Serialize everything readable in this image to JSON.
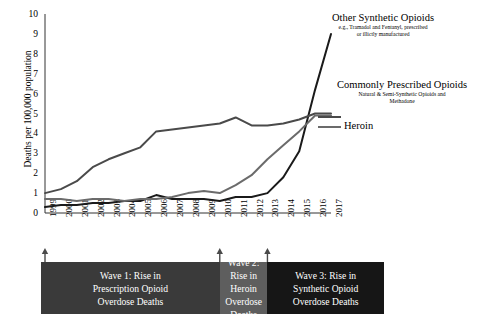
{
  "chart_data": {
    "type": "line",
    "title": "",
    "xlabel": "",
    "ylabel": "Deaths per 100,000 population",
    "ylim": [
      0,
      10
    ],
    "yticks": [
      0,
      1,
      2,
      3,
      4,
      5,
      6,
      7,
      8,
      9,
      10
    ],
    "grid": false,
    "legend_position": "inline-right-annotations",
    "categories": [
      1999,
      2000,
      2001,
      2002,
      2003,
      2004,
      2005,
      2006,
      2007,
      2008,
      2009,
      2010,
      2011,
      2012,
      2013,
      2014,
      2015,
      2016,
      2017
    ],
    "series": [
      {
        "name": "Other Synthetic Opioids",
        "subtitle": "e.g., Tramadol and Fentanyl, prescribed or illicitly manufactured",
        "color": "#1a1a1a",
        "values": [
          0.3,
          0.4,
          0.4,
          0.5,
          0.5,
          0.6,
          0.6,
          0.9,
          0.7,
          0.7,
          0.7,
          0.6,
          0.8,
          0.8,
          1.0,
          1.8,
          3.1,
          6.2,
          9.0
        ]
      },
      {
        "name": "Commonly Prescribed Opioids",
        "subtitle": "Natural & Semi-Synthetic Opioids and Methadone",
        "color": "#4a4a4a",
        "values": [
          1.0,
          1.2,
          1.6,
          2.3,
          2.7,
          3.0,
          3.3,
          4.1,
          4.2,
          4.3,
          4.4,
          4.5,
          4.8,
          4.4,
          4.4,
          4.5,
          4.7,
          5.0,
          5.0
        ]
      },
      {
        "name": "Heroin",
        "subtitle": "",
        "color": "#6b6b6b",
        "values": [
          0.7,
          0.7,
          0.6,
          0.7,
          0.7,
          0.6,
          0.7,
          0.7,
          0.8,
          1.0,
          1.1,
          1.0,
          1.4,
          1.9,
          2.7,
          3.4,
          4.1,
          4.9,
          4.9
        ]
      }
    ],
    "annotations": [
      {
        "id": "wave-1",
        "label": "Wave 1: Rise in Prescription Opioid Overdose Deaths",
        "color": "#3a3a3a",
        "start_year": 1999
      },
      {
        "id": "wave-2",
        "label": "Wave 2: Rise in Heroin Overdose Deaths",
        "color": "#5e5e5e",
        "start_year": 2010
      },
      {
        "id": "wave-3",
        "label": "Wave 3: Rise in Synthetic Opioid Overdose Deaths",
        "color": "#161616",
        "start_year": 2013
      }
    ]
  },
  "labels": {
    "synthetic_title": "Other Synthetic Opioids",
    "synthetic_sub_line1": "e.g., Tramadol and Fentanyl, prescribed",
    "synthetic_sub_line2": "or illictly manufactured",
    "prescribed_title": "Commonly Prescribed Opioids",
    "prescribed_sub_line1": "Natural & Semi-Synthetic Opioids and",
    "prescribed_sub_line2": "Methadone",
    "heroin_title": "Heroin",
    "y_axis_title": "Deaths per 100,000 population"
  },
  "waves": {
    "wave1": {
      "line1": "Wave 1: Rise in",
      "line2": "Prescription Opioid",
      "line3": "Overdose Deaths"
    },
    "wave2": {
      "line1": "Wave 2: Rise in Heroin",
      "line2": "Overdose Deaths"
    },
    "wave3": {
      "line1": "Wave 3: Rise in",
      "line2": "Synthetic Opioid",
      "line3": "Overdose Deaths"
    }
  }
}
